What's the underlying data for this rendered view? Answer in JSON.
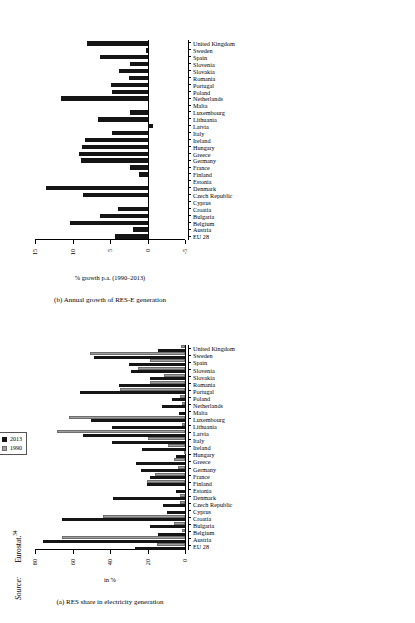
{
  "figure": {
    "source_label": "Source:",
    "source_value": "Eurostat.",
    "source_superscript": "34"
  },
  "chart_data": [
    {
      "id": "chart-a",
      "type": "bar",
      "title": "",
      "caption": "(a) RES share in electricity generation",
      "xlabel": "",
      "ylabel": "in %",
      "ylim": [
        0,
        80
      ],
      "yticks": [
        0,
        20,
        40,
        60,
        80
      ],
      "grid": false,
      "legend_position": "top-right",
      "orientation": "rotated-90-ccw",
      "categories": [
        "EU 28",
        "Austria",
        "Belgium",
        "Bulgaria",
        "Croatia",
        "Cyprus",
        "Czech Republic",
        "Denmark",
        "Estonia",
        "Finland",
        "France",
        "Germany",
        "Greece",
        "Hungary",
        "Ireland",
        "Italy",
        "Latvia",
        "Lithuania",
        "Luxembourg",
        "Malta",
        "Netherlands",
        "Poland",
        "Portugal",
        "Romania",
        "Slovakia",
        "Slovenia",
        "Spain",
        "Sweden",
        "United Kingdom"
      ],
      "series": [
        {
          "name": "2013",
          "color": "#151515",
          "values": [
            26.5,
            75.5,
            14.5,
            18.5,
            65.5,
            9.5,
            11.5,
            38.5,
            5.0,
            20.5,
            18.5,
            23.5,
            26.0,
            5.0,
            23.0,
            39.0,
            54.5,
            39.0,
            50.0,
            3.0,
            12.5,
            7.0,
            56.0,
            35.0,
            18.5,
            29.0,
            30.0,
            48.5,
            14.5
          ]
        },
        {
          "name": "1990",
          "color": "#9f9f9f",
          "values": [
            15.0,
            65.5,
            1.5,
            6.0,
            44.0,
            0.0,
            2.5,
            2.5,
            0.0,
            20.5,
            16.0,
            4.0,
            6.0,
            0.5,
            9.0,
            19.5,
            68.5,
            1.5,
            62.0,
            0.0,
            1.5,
            2.5,
            34.5,
            18.5,
            11.0,
            25.0,
            18.5,
            50.5,
            2.0
          ]
        }
      ]
    },
    {
      "id": "chart-b",
      "type": "bar",
      "title": "",
      "caption": "(b) Annual growth of RES-E generation",
      "xlabel": "",
      "ylabel": "% growth p.a. (1990–2013)",
      "ylim": [
        -5,
        15
      ],
      "yticks": [
        -5,
        0,
        5,
        10,
        15
      ],
      "grid": false,
      "legend_position": "none",
      "orientation": "rotated-90-ccw",
      "categories": [
        "EU 28",
        "Austria",
        "Belgium",
        "Bulgaria",
        "Croatia",
        "Cyprus",
        "Czech Republic",
        "Denmark",
        "Estonia",
        "Finland",
        "France",
        "Germany",
        "Greece",
        "Hungary",
        "Ireland",
        "Italy",
        "Latvia",
        "Lithuania",
        "Luxembourg",
        "Malta",
        "Netherlands",
        "Poland",
        "Portugal",
        "Romania",
        "Slovakia",
        "Slovenia",
        "Spain",
        "Sweden",
        "United Kingdom"
      ],
      "series": [
        {
          "name": "% growth p.a. (1990–2013)",
          "color": "#151515",
          "values": [
            4.3,
            2.0,
            10.3,
            6.3,
            3.9,
            0.0,
            8.6,
            13.6,
            0.0,
            1.2,
            2.4,
            8.9,
            9.1,
            8.8,
            8.3,
            4.7,
            -0.7,
            6.6,
            2.4,
            0.0,
            11.6,
            4.8,
            4.9,
            2.5,
            3.8,
            2.4,
            6.4,
            0.2,
            8.1
          ]
        }
      ]
    }
  ]
}
